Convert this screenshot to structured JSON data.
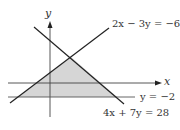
{
  "diagram": {
    "type": "linear-inequality-feasible-region",
    "axes": {
      "x_label": "x",
      "y_label": "y"
    },
    "lines": [
      {
        "id": "line1",
        "equation": "2x − 3y = −6"
      },
      {
        "id": "line2",
        "equation": "4x + 7y = 28"
      },
      {
        "id": "line3",
        "equation": "y = −2"
      }
    ],
    "shaded_region": "triangle bounded by 2x − 3y = −6, 4x + 7y = 28, and y = −2",
    "colors": {
      "line": "#222222",
      "axis": "#333333",
      "fill": "#d6d6d6",
      "label": "#333333"
    }
  }
}
